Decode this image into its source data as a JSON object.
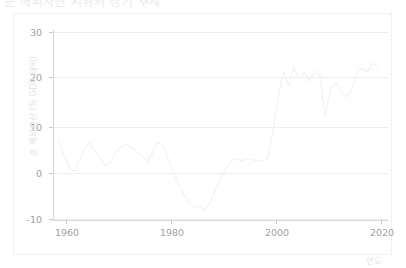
{
  "title": "순 해외자산 지위의 장기 추세",
  "chart_data": {
    "type": "line",
    "title": "순 해외자산 지위의 장기 추세",
    "xlabel": "연도",
    "ylabel": "순 해외자산 (% GDP 대비)",
    "xlim": [
      1956,
      2020
    ],
    "ylim": [
      -12,
      32
    ],
    "xticks": [
      1960,
      1980,
      2000,
      2020
    ],
    "yticks": [
      -10,
      0,
      10,
      20,
      30
    ],
    "xtick_labels": [
      "1960",
      "1980",
      "2000",
      "2020"
    ],
    "ytick_labels": [
      "-10",
      "0",
      "10",
      "20",
      "30"
    ],
    "grid": true,
    "legend": "none",
    "line_color": "#f2f2f4",
    "series": [
      {
        "name": "순 해외자산 (% GDP 대비)",
        "x": [
          1957,
          1958,
          1959,
          1960,
          1961,
          1962,
          1963,
          1964,
          1965,
          1966,
          1967,
          1968,
          1969,
          1970,
          1971,
          1972,
          1973,
          1974,
          1975,
          1976,
          1977,
          1978,
          1979,
          1980,
          1981,
          1982,
          1983,
          1984,
          1985,
          1986,
          1987,
          1988,
          1989,
          1990,
          1991,
          1992,
          1993,
          1994,
          1995,
          1996,
          1997,
          1998,
          1999,
          2000,
          2001,
          2002,
          2003,
          2004,
          2005,
          2006,
          2007,
          2008,
          2009,
          2010,
          2011,
          2012,
          2013,
          2014,
          2015,
          2016,
          2017,
          2018
        ],
        "values": [
          6.8,
          4.2,
          1.5,
          0.2,
          2.6,
          5.2,
          6.4,
          4.6,
          3.1,
          1.6,
          2.2,
          4.4,
          5.6,
          6.1,
          5.4,
          4.5,
          3.6,
          2.5,
          4.2,
          6.6,
          5.8,
          3.0,
          0.2,
          -2.4,
          -4.6,
          -6.6,
          -7.4,
          -7.2,
          -8.1,
          -6.3,
          -3.8,
          -1.4,
          0.8,
          2.4,
          3.1,
          2.6,
          3.0,
          2.8,
          2.6,
          2.4,
          3.0,
          9.0,
          16.0,
          21.8,
          18.6,
          22.6,
          20.2,
          21.4,
          19.6,
          21.8,
          20.6,
          12.3,
          18.0,
          19.4,
          17.4,
          16.2,
          17.8,
          21.0,
          22.4,
          21.6,
          23.4,
          22.8
        ]
      }
    ]
  },
  "axis": {
    "ylabel": "순 해외자산 (% GDP 대비)",
    "xlabel": "연도",
    "yticks": [
      {
        "label": "30",
        "value": 30
      },
      {
        "label": "20",
        "value": 20
      },
      {
        "label": "10",
        "value": 10
      },
      {
        "label": "0",
        "value": 0
      },
      {
        "label": "-10",
        "value": -10
      }
    ],
    "xticks": [
      {
        "label": "1960",
        "value": 1960
      },
      {
        "label": "1980",
        "value": 1980
      },
      {
        "label": "2000",
        "value": 2000
      },
      {
        "label": "2020",
        "value": 2020
      }
    ]
  },
  "colors": {
    "line": "#f2f2f4",
    "grid": "#eeeef0",
    "axis": "#d8d8dc",
    "tick_text": "#9fa0a4",
    "label_text": "#e4e4e8",
    "frame": "#f0f0f2",
    "background": "#ffffff"
  }
}
